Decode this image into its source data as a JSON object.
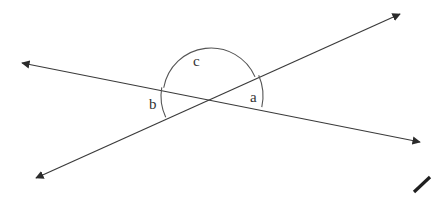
{
  "figure": {
    "kind": "geometry-diagram",
    "background_color": "#ffffff",
    "stroke_color": "#3a3a3a",
    "label_color": "#333333",
    "width": 441,
    "height": 198
  },
  "intersection": {
    "label": "",
    "x": 211,
    "y": 96
  },
  "lines": [
    {
      "name": "line-upperleft-lowerright",
      "start": {
        "x": 22,
        "y": 63
      },
      "end": {
        "x": 420,
        "y": 142
      },
      "arrow_start": true,
      "arrow_end": true,
      "stroke_width": 1.2
    },
    {
      "name": "line-lowerleft-upperright",
      "start": {
        "x": 36,
        "y": 178
      },
      "end": {
        "x": 400,
        "y": 14
      },
      "arrow_start": true,
      "arrow_end": true,
      "stroke_width": 1.2
    }
  ],
  "angles": [
    {
      "name": "angle-a",
      "label": "a",
      "position": "right",
      "label_x": 255,
      "label_y": 98,
      "arc_radius": 52,
      "from_ray": "upper-right",
      "to_ray": "lower-right"
    },
    {
      "name": "angle-b",
      "label": "b",
      "position": "left",
      "label_x": 154,
      "label_y": 105,
      "arc_radius": 50,
      "from_ray": "upper-left",
      "to_ray": "lower-left"
    },
    {
      "name": "angle-c",
      "label": "c",
      "position": "top",
      "label_x": 198,
      "label_y": 62,
      "arc_radius": 48,
      "from_ray": "upper-left",
      "to_ray": "upper-right"
    }
  ],
  "marks": [
    {
      "name": "corner-tick-mark",
      "start": {
        "x": 414,
        "y": 192
      },
      "end": {
        "x": 430,
        "y": 177
      },
      "stroke_width": 3.2
    }
  ]
}
